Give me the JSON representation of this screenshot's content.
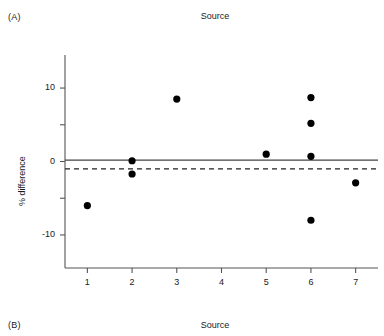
{
  "panels": [
    {
      "label": "(A)",
      "title": "Source"
    },
    {
      "label": "(B)",
      "title": "Source"
    }
  ],
  "axis": {
    "ylabel": "% difference",
    "yticks": [
      "10",
      "0",
      "-10"
    ],
    "xticks": [
      "1",
      "2",
      "3",
      "4",
      "5",
      "6",
      "7"
    ]
  },
  "colors": {
    "point": "#000000",
    "axis": "#555555",
    "solid_line": "#444444",
    "dashed_line": "#222222",
    "text": "#1a1a1a"
  },
  "chart_data": {
    "type": "scatter",
    "title": "Source",
    "xlabel": "",
    "ylabel": "% difference",
    "xlim": [
      0.5,
      7.5
    ],
    "ylim": [
      -14.5,
      14.5
    ],
    "xticks": [
      1,
      2,
      3,
      4,
      5,
      6,
      7
    ],
    "yticks": [
      10,
      5,
      0,
      -5,
      -10
    ],
    "ytick_labels": [
      "10",
      "",
      "0",
      "",
      "-10"
    ],
    "grid": false,
    "legend": "none",
    "points": [
      {
        "x": 1,
        "y": -6.0
      },
      {
        "x": 2,
        "y": 0.1
      },
      {
        "x": 2,
        "y": -1.7
      },
      {
        "x": 3,
        "y": 8.5
      },
      {
        "x": 5,
        "y": 1.0
      },
      {
        "x": 6,
        "y": 8.7
      },
      {
        "x": 6,
        "y": 5.2
      },
      {
        "x": 6,
        "y": 0.7
      },
      {
        "x": 6,
        "y": -8.0
      },
      {
        "x": 7,
        "y": -2.9
      }
    ],
    "reference_lines": [
      {
        "name": "solid",
        "y": 0.2,
        "style": "solid"
      },
      {
        "name": "dashed",
        "y": -1.0,
        "style": "dashed"
      }
    ]
  }
}
